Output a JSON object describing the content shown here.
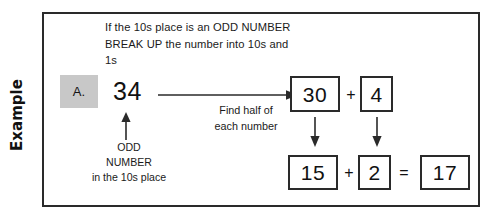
{
  "worksheet": {
    "section_label": "Example",
    "instruction": "If the 10s place is an ODD NUMBER BREAK UP the number into 10s and 1s",
    "item_letter": "A.",
    "start_number": "34",
    "odd_note_line1": "ODD",
    "odd_note_line2": "NUMBER",
    "odd_note_line3": "in the 10s place",
    "half_note_line1": "Find half of",
    "half_note_line2": "each number",
    "colors": {
      "border": "#2a2a2a",
      "chip_background": "#c8c8c8",
      "text": "#1a1a1a",
      "page_background": "#ffffff"
    }
  },
  "decomposition": {
    "tens": "30",
    "ones": "4",
    "plus_operator": "+"
  },
  "halves": {
    "half_tens": "15",
    "half_ones": "2",
    "plus_operator": "+",
    "equals_operator": "=",
    "result": "17"
  },
  "icons": {
    "main_arrow": "arrow-right-icon",
    "up_arrow": "arrow-up-icon",
    "down_arrow_tens": "arrow-down-icon",
    "down_arrow_ones": "arrow-down-icon"
  }
}
